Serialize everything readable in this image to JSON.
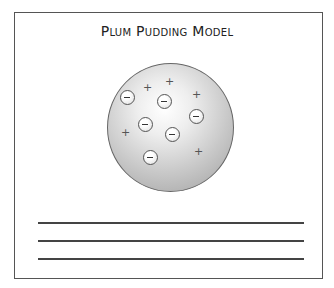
{
  "title": "Plum Pudding Model",
  "diagram": {
    "sphere": {
      "label": "positive sphere",
      "color": "#c8c8c8"
    },
    "electrons": [
      {
        "x": 127,
        "y": 97
      },
      {
        "x": 164,
        "y": 101
      },
      {
        "x": 196,
        "y": 116
      },
      {
        "x": 145,
        "y": 124
      },
      {
        "x": 172,
        "y": 134
      },
      {
        "x": 150,
        "y": 157
      }
    ],
    "electron_symbol": "−",
    "protons": [
      {
        "x": 146,
        "y": 88
      },
      {
        "x": 168,
        "y": 82
      },
      {
        "x": 195,
        "y": 95
      },
      {
        "x": 124,
        "y": 133
      },
      {
        "x": 197,
        "y": 152
      }
    ],
    "proton_symbol": "+"
  },
  "answer_lines": 3
}
